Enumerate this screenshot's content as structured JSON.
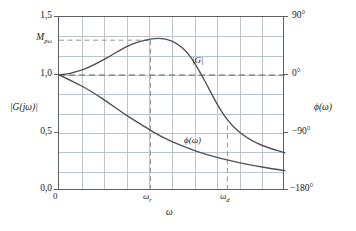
{
  "chart_data": {
    "type": "line",
    "title": "",
    "xlabel": "ω",
    "ylabel_left": "|G(jω)|",
    "ylabel_right": "ϕ(ω)",
    "grid": true,
    "legend_position": "inline-annotations",
    "x_axis": {
      "origin_label": "0",
      "tick_labels": [
        "ω",
        "ω"
      ],
      "tick_subscripts": [
        "r",
        "d"
      ],
      "tick_positions_frac": [
        0.405,
        0.745
      ]
    },
    "y_axis_left": {
      "label": "|G(jω)|",
      "range": [
        0.0,
        1.5
      ],
      "tick_labels": [
        "0,0",
        "0,5",
        "1,0",
        "1,5"
      ],
      "tick_values": [
        0.0,
        0.5,
        1.0,
        1.5
      ],
      "special_tick_label": "M",
      "special_tick_subscript": "pω",
      "special_tick_value": 1.3
    },
    "y_axis_right": {
      "label": "ϕ(ω)",
      "range": [
        -180,
        90
      ],
      "tick_labels": [
        "90°",
        "0°",
        "−90°",
        "−180°"
      ],
      "tick_values": [
        90,
        0,
        -90,
        -180
      ]
    },
    "annotations": [
      {
        "text": "|G|",
        "x_frac": 0.6,
        "y_frac": 0.345
      },
      {
        "text": "ϕ(ω)",
        "x_frac": 0.575,
        "y_frac": 0.745
      }
    ],
    "reference_lines": [
      {
        "orientation": "horizontal",
        "value": 1.0,
        "axis": "left",
        "style": "dashed"
      },
      {
        "orientation": "horizontal",
        "value": 1.3,
        "axis": "left",
        "style": "dashed",
        "label": "M_pω"
      },
      {
        "orientation": "vertical",
        "value": "ω_r",
        "style": "dashed"
      },
      {
        "orientation": "vertical",
        "value": "ω_d",
        "style": "dashed"
      }
    ],
    "series": [
      {
        "name": "|G|",
        "axis": "left",
        "description": "magnitude: starts at 1,0 rises to resonant peak M_pω at ω_r then rolls off",
        "points": [
          [
            0.0,
            1.0
          ],
          [
            0.05,
            1.01
          ],
          [
            0.1,
            1.03
          ],
          [
            0.15,
            1.06
          ],
          [
            0.2,
            1.1
          ],
          [
            0.25,
            1.15
          ],
          [
            0.3,
            1.205
          ],
          [
            0.35,
            1.258
          ],
          [
            0.405,
            1.3
          ],
          [
            0.46,
            1.288
          ],
          [
            0.5,
            1.262
          ],
          [
            0.55,
            1.205
          ],
          [
            0.6,
            1.12
          ],
          [
            0.65,
            1.01
          ],
          [
            0.7,
            0.885
          ],
          [
            0.75,
            0.76
          ],
          [
            0.8,
            0.648
          ],
          [
            0.85,
            0.552
          ],
          [
            0.9,
            0.475
          ],
          [
            0.95,
            0.418
          ],
          [
            1.0,
            0.38
          ]
        ]
      },
      {
        "name": "ϕ(ω)",
        "axis": "right",
        "description": "phase: starts at 0° and decreases monotonically toward −180°",
        "points": [
          [
            0.0,
            0.0
          ],
          [
            0.05,
            -8.0
          ],
          [
            0.1,
            -17.0
          ],
          [
            0.15,
            -27.0
          ],
          [
            0.2,
            -38.0
          ],
          [
            0.25,
            -50.0
          ],
          [
            0.3,
            -62.0
          ],
          [
            0.35,
            -74.0
          ],
          [
            0.405,
            -86.0
          ],
          [
            0.46,
            -97.0
          ],
          [
            0.5,
            -105.0
          ],
          [
            0.55,
            -114.0
          ],
          [
            0.6,
            -122.0
          ],
          [
            0.65,
            -130.0
          ],
          [
            0.7,
            -137.0
          ],
          [
            0.745,
            -143.0
          ],
          [
            0.8,
            -149.0
          ],
          [
            0.85,
            -154.0
          ],
          [
            0.9,
            -159.0
          ],
          [
            0.95,
            -163.0
          ],
          [
            1.0,
            -167.0
          ]
        ]
      }
    ]
  },
  "axes": {
    "left_title": "|G(jω)|",
    "right_title": "ϕ(ω)",
    "bottom_title": "ω",
    "origin": "0"
  },
  "ticks": {
    "left": [
      "1,5",
      "1,0",
      "0,5",
      "0,0"
    ],
    "right": [
      "90°",
      "0°",
      "−90°",
      "−180°"
    ],
    "peak_base": "M",
    "peak_sub": "pω",
    "x1_base": "ω",
    "x1_sub": "r",
    "x2_base": "ω",
    "x2_sub": "d"
  },
  "inline": {
    "mag": "|G|",
    "phase": "ϕ(ω)"
  },
  "colors": {
    "frame": "#5a5f63",
    "grid": "#b9c4cc",
    "curve": "#4c5257",
    "dashed": "#7d8388"
  }
}
